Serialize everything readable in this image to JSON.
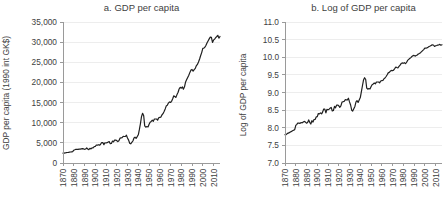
{
  "colors": {
    "background": "#ffffff",
    "line": "#1f1f1f",
    "grid": "#ededed",
    "axis": "#9a9a9a",
    "text": "#3e3e3e"
  },
  "chart_data": [
    {
      "type": "line",
      "title": "a. GDP per capita",
      "ylabel": "GDP per capita (1990 int GK$)",
      "xlabel": "",
      "x_start": 1870,
      "x_end": 2016,
      "x_step": 1,
      "ylim": [
        0,
        35000
      ],
      "yticks": [
        0,
        5000,
        10000,
        15000,
        20000,
        25000,
        30000,
        35000
      ],
      "ytick_labels": [
        "0",
        "5,000",
        "10,000",
        "15,000",
        "20,000",
        "25,000",
        "30,000",
        "35,000"
      ],
      "xticks": [
        1870,
        1880,
        1890,
        1900,
        1910,
        1920,
        1930,
        1940,
        1950,
        1960,
        1970,
        1980,
        1990,
        2000,
        2010
      ],
      "grid": true,
      "legend": null,
      "series": [
        {
          "name": "GDP per capita (1990 int GK$)",
          "values": [
            2445,
            2457,
            2524,
            2562,
            2601,
            2643,
            2686,
            2732,
            2780,
            2829,
            3184,
            3287,
            3411,
            3397,
            3372,
            3461,
            3431,
            3511,
            3566,
            3502,
            3392,
            3467,
            3728,
            3478,
            3314,
            3644,
            3504,
            3769,
            3780,
            4051,
            4091,
            4464,
            4421,
            4551,
            4410,
            4642,
            5079,
            5065,
            4561,
            5017,
            4964,
            5046,
            5201,
            5301,
            4799,
            4864,
            5459,
            5248,
            5659,
            5680,
            5552,
            5323,
            5540,
            6164,
            6233,
            6282,
            6602,
            6576,
            6569,
            6899,
            6213,
            5691,
            4908,
            4777,
            5114,
            5467,
            6204,
            6430,
            6126,
            6561,
            7010,
            8206,
            9741,
            11518,
            12333,
            11709,
            9197,
            8886,
            9065,
            8944,
            9561,
            10116,
            10316,
            10613,
            10359,
            10897,
            10914,
            10920,
            10631,
            11230,
            11328,
            11402,
            11905,
            12242,
            12773,
            13419,
            14134,
            14330,
            14863,
            15179,
            15030,
            15304,
            15944,
            16689,
            16491,
            16284,
            16975,
            17567,
            18373,
            18789,
            18577,
            18856,
            18325,
            18920,
            20123,
            20717,
            21236,
            21788,
            22499,
            23059,
            23201,
            22785,
            23169,
            23477,
            24130,
            24484,
            25066,
            25819,
            26619,
            27395,
            28467,
            28501,
            28736,
            29241,
            29845,
            30336,
            30809,
            31261,
            31178,
            29946,
            30491,
            30755,
            31091,
            31389,
            31700,
            31000,
            31400
          ]
        }
      ]
    },
    {
      "type": "line",
      "title": "b. Log of GDP per capita",
      "ylabel": "Log of GDP per capita",
      "xlabel": "",
      "x_start": 1870,
      "x_end": 2016,
      "x_step": 1,
      "ylim": [
        7,
        11
      ],
      "yticks": [
        7,
        7.5,
        8,
        8.5,
        9,
        9.5,
        10,
        10.5,
        11
      ],
      "ytick_labels": [
        "7.0",
        "7.5",
        "8.0",
        "8.5",
        "9.0",
        "9.5",
        "10.0",
        "10.5",
        "11.0"
      ],
      "xticks": [
        1870,
        1880,
        1890,
        1900,
        1910,
        1920,
        1930,
        1940,
        1950,
        1960,
        1970,
        1980,
        1990,
        2000,
        2010
      ],
      "grid": true,
      "legend": null,
      "series": [
        {
          "name": "Log of GDP per capita",
          "derived": "ln",
          "source_chart": 0
        }
      ]
    }
  ]
}
